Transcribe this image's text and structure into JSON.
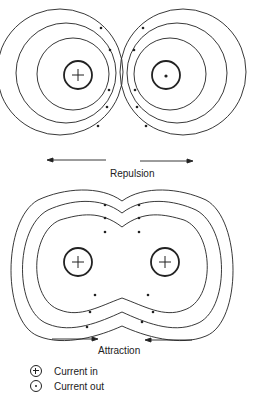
{
  "diagram": {
    "top": {
      "label": "Repulsion",
      "conductors": [
        {
          "id": "left",
          "symbol": "plus",
          "meaning": "Current in"
        },
        {
          "id": "right",
          "symbol": "dot",
          "meaning": "Current out"
        }
      ],
      "force_arrows": [
        "left",
        "right"
      ]
    },
    "bottom": {
      "label": "Attraction",
      "conductors": [
        {
          "id": "left",
          "symbol": "plus",
          "meaning": "Current in"
        },
        {
          "id": "right",
          "symbol": "plus",
          "meaning": "Current in"
        }
      ],
      "force_arrows": [
        "right",
        "left"
      ]
    },
    "legend": [
      {
        "symbol": "plus",
        "label": "Current in"
      },
      {
        "symbol": "dot",
        "label": "Current out"
      }
    ]
  },
  "colors": {
    "line": "#222222",
    "background": "#ffffff"
  }
}
